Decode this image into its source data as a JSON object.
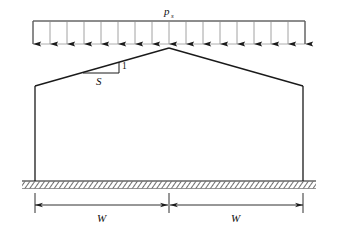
{
  "figure": {
    "type": "engineering-diagram",
    "colors": {
      "line": "#1a1a1a",
      "text": "#111111",
      "ground_hatch": "#555555",
      "background": "#ffffff"
    }
  },
  "labels": {
    "load_symbol": "p",
    "load_subscript": "s",
    "slope_rise": "1",
    "slope_run": "S",
    "width_left": "W",
    "width_right": "W"
  },
  "load_block": {
    "name": "uniform-distributed-load",
    "arrow_count": 17,
    "direction": "down",
    "x_start": 33,
    "x_end": 305,
    "top_y": 21,
    "bottom_y": 44
  },
  "frame": {
    "apex": {
      "x": 169,
      "y": 48
    },
    "left_eave": {
      "x": 35,
      "y": 86
    },
    "right_eave": {
      "x": 303,
      "y": 86
    },
    "base_y": 181
  },
  "ground": {
    "name": "ground-hatching",
    "x_start": 22,
    "x_end": 316,
    "y": 181
  },
  "dimensions": [
    {
      "label": "W",
      "from_x": 35,
      "to_x": 169,
      "y": 205
    },
    {
      "label": "W",
      "from_x": 169,
      "to_x": 303,
      "y": 205
    }
  ],
  "chart_data": {
    "type": "diagram",
    "elements": [
      {
        "name": "load-pressure",
        "symbol": "p_s",
        "distribution": "uniform",
        "arrows": 17
      },
      {
        "name": "roof-slope",
        "rise": 1,
        "run": "S"
      },
      {
        "name": "half-span-left",
        "symbol": "W"
      },
      {
        "name": "half-span-right",
        "symbol": "W"
      }
    ]
  }
}
